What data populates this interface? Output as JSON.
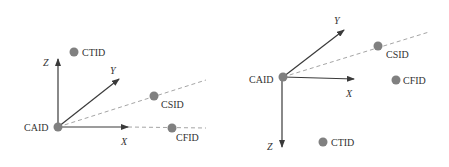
{
  "colors": {
    "axis": "#3a3a3a",
    "point": "#808080",
    "dashed": "#9a9a9a",
    "text": "#333333"
  },
  "diagrams": [
    {
      "name": "left-frame",
      "origin_label": "CAID",
      "axes": {
        "x": "X",
        "y": "Y",
        "z": "Z"
      },
      "points": [
        {
          "label": "CTID"
        },
        {
          "label": "CSID"
        },
        {
          "label": "CFID"
        }
      ]
    },
    {
      "name": "right-frame",
      "origin_label": "CAID",
      "axes": {
        "x": "X",
        "y": "Y",
        "z": "Z"
      },
      "points": [
        {
          "label": "CSID"
        },
        {
          "label": "CFID"
        },
        {
          "label": "CTID"
        }
      ]
    }
  ]
}
